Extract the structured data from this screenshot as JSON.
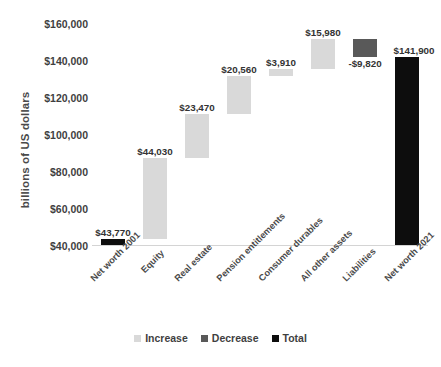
{
  "chart_data": {
    "type": "bar",
    "subtype": "waterfall",
    "title": "",
    "xlabel": "",
    "ylabel": "billions of US dollars",
    "ylim": [
      40000,
      160000
    ],
    "ytick_values": [
      40000,
      60000,
      80000,
      100000,
      120000,
      140000,
      160000
    ],
    "ytick_labels": [
      "$40,000",
      "$60,000",
      "$80,000",
      "$100,000",
      "$120,000",
      "$140,000",
      "$160,000"
    ],
    "grid": false,
    "legend_position": "bottom",
    "categories": [
      "Net worth 2001",
      "Equity",
      "Real estate",
      "Pension entitlements",
      "Consumer durables",
      "All other assets",
      "Liabilities",
      "Net worth 2021"
    ],
    "values": [
      43770,
      44030,
      23470,
      20560,
      3910,
      15980,
      -9820,
      141900
    ],
    "value_labels": [
      "$43,770",
      "$44,030",
      "$23,470",
      "$20,560",
      "$3,910",
      "$15,980",
      "-$9,820",
      "$141,900"
    ],
    "kinds": [
      "total",
      "increase",
      "increase",
      "increase",
      "increase",
      "increase",
      "decrease",
      "total"
    ],
    "bar_bottoms": [
      40000,
      43770,
      87800,
      111270,
      131830,
      135740,
      141900,
      40000
    ],
    "bar_tops": [
      43770,
      87800,
      111270,
      131830,
      135740,
      151720,
      151720,
      141900
    ],
    "legend": [
      {
        "label": "Increase",
        "color": "#d9d9d9"
      },
      {
        "label": "Decrease",
        "color": "#595959"
      },
      {
        "label": "Total",
        "color": "#0d0d0d"
      }
    ],
    "colors": {
      "increase": "#d9d9d9",
      "decrease": "#595959",
      "total": "#0d0d0d",
      "axis": "#d4d4d4",
      "text": "#3f3f3f"
    }
  }
}
